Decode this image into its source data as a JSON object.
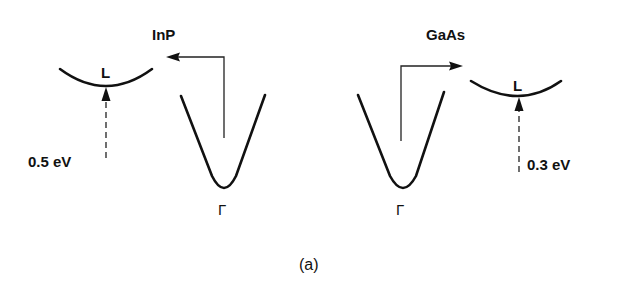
{
  "figure": {
    "caption": "(a)",
    "panels": [
      {
        "material": "InP",
        "gamma_label": "Γ",
        "l_label": "L",
        "energy_separation": "0.5 eV",
        "transfer_direction": "left"
      },
      {
        "material": "GaAs",
        "gamma_label": "Γ",
        "l_label": "L",
        "energy_separation": "0.3 eV",
        "transfer_direction": "right"
      }
    ]
  },
  "colors": {
    "line": "#111111",
    "background": "#ffffff"
  }
}
